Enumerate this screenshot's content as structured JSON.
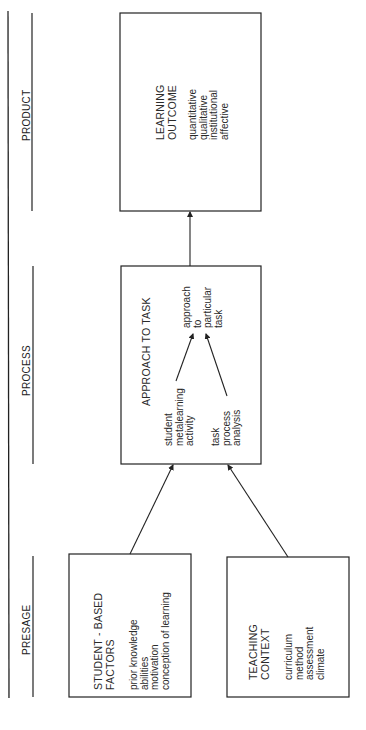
{
  "stages": {
    "product": "PRODUCT",
    "process": "PROCESS",
    "presage": "PRESAGE"
  },
  "boxes": {
    "learning_outcome": {
      "title": [
        "LEARNING",
        "OUTCOME"
      ],
      "items": [
        "quantitative",
        "qualitative",
        "institutional",
        "affective"
      ]
    },
    "approach_to_task": {
      "title": "APPROACH TO TASK",
      "student": [
        "student",
        "metalearning",
        "activity"
      ],
      "task": [
        "task",
        "process",
        "analysis"
      ],
      "approach": [
        "approach",
        "to",
        "particular",
        "task"
      ]
    },
    "student_based_factors": {
      "title": [
        "STUDENT - BASED",
        "FACTORS"
      ],
      "items": [
        "prior  knowledge",
        "abilities",
        "motivation",
        "conception  of  learning"
      ]
    },
    "teaching_context": {
      "title": [
        "TEACHING",
        "CONTEXT"
      ],
      "items": [
        "curriculum",
        "method",
        "assessment",
        "climate"
      ]
    }
  },
  "colors": {
    "line": "#222222",
    "background": "#ffffff"
  }
}
